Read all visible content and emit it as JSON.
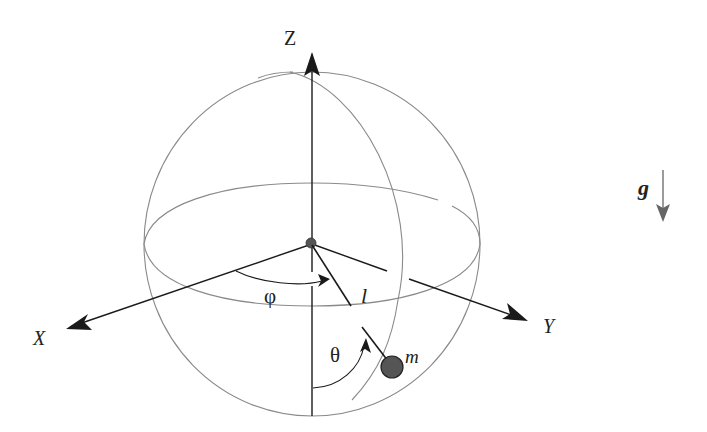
{
  "diagram": {
    "type": "spherical-pendulum",
    "labels": {
      "z_axis": "Z",
      "x_axis": "X",
      "y_axis": "Y",
      "azimuth_angle": "φ",
      "polar_angle": "θ",
      "length": "l",
      "mass": "m",
      "gravity": "g"
    },
    "colors": {
      "background": "#ffffff",
      "axis": "#1a1a1a",
      "sphere_wire": "#8a8a8a",
      "mass_fill": "#555555",
      "gravity_arrow": "#666666"
    },
    "geometry": {
      "sphere_center": [
        312,
        244
      ],
      "sphere_rx": 168,
      "sphere_ry": 172,
      "equator_ry": 60,
      "mass_position": [
        393,
        367
      ],
      "mass_radius": 11
    }
  }
}
